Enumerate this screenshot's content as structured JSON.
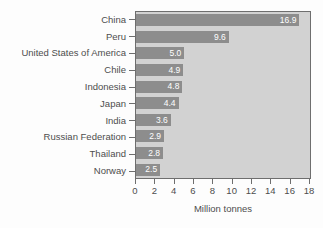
{
  "chart_data": {
    "type": "bar",
    "orientation": "horizontal",
    "title": "",
    "subtitle": "",
    "xlabel": "Million tonnes",
    "ylabel": "",
    "categories": [
      "China",
      "Peru",
      "United States of America",
      "Chile",
      "Indonesia",
      "Japan",
      "India",
      "Russian Federation",
      "Thailand",
      "Norway"
    ],
    "values": [
      16.9,
      9.6,
      5.0,
      4.9,
      4.8,
      4.4,
      3.6,
      2.9,
      2.8,
      2.5
    ],
    "value_labels": [
      "16.9",
      "9.6",
      "5.0",
      "4.9",
      "4.8",
      "4.4",
      "3.6",
      "2.9",
      "2.8",
      "2.5"
    ],
    "xlim": [
      0,
      18
    ],
    "xticks": [
      0,
      2,
      4,
      6,
      8,
      10,
      12,
      14,
      16,
      18
    ],
    "xtick_labels": [
      "0",
      "2",
      "4",
      "6",
      "8",
      "10",
      "12",
      "14",
      "16",
      "18"
    ],
    "grid": false,
    "legend": null,
    "colors": {
      "bar": "#8d8d8d",
      "plot_background": "#d2d2d2",
      "page_background": "#fdfdfd",
      "axis_line": "#6e6e6e",
      "label_text": "#4d4d4d",
      "value_label_text": "#ffffff"
    }
  }
}
